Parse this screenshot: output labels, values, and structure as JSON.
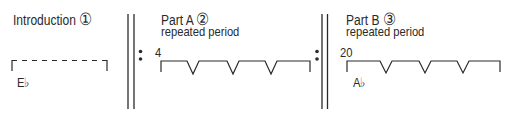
{
  "sections": [
    {
      "id": "introduction",
      "title": "Introduction",
      "marker": "①",
      "subtitle": "",
      "measure_number": "",
      "key": "E♭",
      "bracket_style": "dashed"
    },
    {
      "id": "part-a",
      "title": "Part A",
      "marker": "②",
      "subtitle": "repeated period",
      "measure_number": "4",
      "key": "",
      "bracket_style": "notched",
      "notches": 3
    },
    {
      "id": "part-b",
      "title": "Part B",
      "marker": "③",
      "subtitle": "repeated period",
      "measure_number": "20",
      "key": "A♭",
      "bracket_style": "notched",
      "notches": 3
    }
  ],
  "repeat_signs": [
    {
      "position": "start-part-a",
      "type": "begin-repeat"
    },
    {
      "position": "end-part-a",
      "type": "end-repeat"
    }
  ],
  "colors": {
    "ink": "#2a2a2a",
    "background": "#ffffff"
  }
}
